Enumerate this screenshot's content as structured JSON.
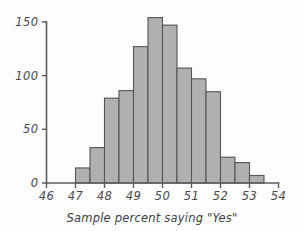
{
  "chart_data": {
    "type": "bar",
    "title": "",
    "subtitle": "",
    "xlabel": "Sample percent saying \"Yes\"",
    "ylabel": "",
    "grid": false,
    "legend": false,
    "legend_position": "none",
    "bin_width": 0.5,
    "xlim": [
      46,
      54
    ],
    "ylim": [
      0,
      158
    ],
    "xticks": [
      46,
      47,
      48,
      49,
      50,
      51,
      52,
      53,
      54
    ],
    "xtick_labels": [
      "46",
      "47",
      "48",
      "49",
      "50",
      "51",
      "52",
      "53",
      "54"
    ],
    "yticks": [
      0,
      50,
      100,
      150
    ],
    "ytick_labels": [
      "0",
      "50",
      "100",
      "150"
    ],
    "bin_edges": [
      47.0,
      47.5,
      48.0,
      48.5,
      49.0,
      49.5,
      50.0,
      50.5,
      51.0,
      51.5,
      52.0,
      52.5,
      53.0,
      53.5
    ],
    "categories": [
      "47.0-47.5",
      "47.5-48.0",
      "48.0-48.5",
      "48.5-49.0",
      "49.0-49.5",
      "49.5-50.0",
      "50.0-50.5",
      "50.5-51.0",
      "51.0-51.5",
      "51.5-52.0",
      "52.0-52.5",
      "52.5-53.0",
      "53.0-53.5"
    ],
    "values": [
      14,
      33,
      79,
      86,
      127,
      154,
      147,
      107,
      97,
      85,
      24,
      19,
      7
    ],
    "colors": {
      "bar_fill": "#b0b0b0",
      "bar_stroke": "#555555",
      "axis": "#5b5b5b",
      "text": "#4a4a4a",
      "background": "#fdfdfd"
    }
  }
}
